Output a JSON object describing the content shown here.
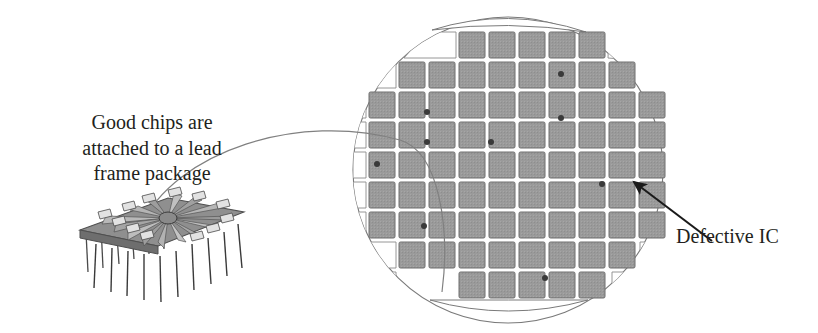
{
  "figure": {
    "name": "semiconductor-wafer-die-map",
    "background_color": "#ffffff"
  },
  "labels": {
    "good_chips": {
      "line1": "Good chips are",
      "line2": "attached to a lead",
      "line3": "frame package"
    },
    "defective": "Defective IC"
  },
  "colors": {
    "die_fill": "#9a9a9a",
    "die_stroke": "#6f6f6f",
    "partial_die_fill": "#ffffff",
    "partial_die_stroke": "#8a8a8a",
    "wafer_stroke": "#7a7a7a",
    "defect_dot": "#3a3a3a",
    "leader_line": "#808080",
    "arrow": "#1a1a1a",
    "package_body": "#8f8f8f",
    "package_dark": "#5f5f5f",
    "package_light": "#cfcfcf",
    "text": "#231f20"
  },
  "wafer": {
    "center_x": 508,
    "center_y": 170,
    "radius_x": 155,
    "radius_y": 153,
    "die_pitch": 30,
    "die_size": 26,
    "grid_origin_x": 369,
    "grid_origin_y": 32,
    "columns": 10,
    "rows": 10,
    "die_rows": [
      {
        "row": 0,
        "y": 32,
        "full_dies_x": [
          459,
          489,
          519,
          549,
          579
        ],
        "partial_dies": [
          {
            "x": 429,
            "w": 26
          },
          {
            "x": 609,
            "w": 26
          }
        ]
      },
      {
        "row": 1,
        "y": 62,
        "full_dies_x": [
          399,
          429,
          459,
          489,
          519,
          549,
          579,
          609
        ],
        "partial_dies": [
          {
            "x": 369,
            "w": 26
          },
          {
            "x": 639,
            "w": 22
          }
        ]
      },
      {
        "row": 2,
        "y": 92,
        "full_dies_x": [
          369,
          399,
          429,
          459,
          489,
          519,
          549,
          579,
          609,
          639
        ],
        "partial_dies": []
      },
      {
        "row": 3,
        "y": 122,
        "full_dies_x": [
          369,
          399,
          429,
          459,
          489,
          519,
          549,
          579,
          609,
          639
        ],
        "partial_dies": []
      },
      {
        "row": 4,
        "y": 152,
        "full_dies_x": [
          369,
          399,
          429,
          459,
          489,
          519,
          549,
          579,
          609,
          639
        ],
        "partial_dies": []
      },
      {
        "row": 5,
        "y": 182,
        "full_dies_x": [
          369,
          399,
          429,
          459,
          489,
          519,
          549,
          579,
          609,
          639
        ],
        "partial_dies": []
      },
      {
        "row": 6,
        "y": 212,
        "full_dies_x": [
          369,
          399,
          429,
          459,
          489,
          519,
          549,
          579,
          609,
          639
        ],
        "partial_dies": []
      },
      {
        "row": 7,
        "y": 242,
        "full_dies_x": [
          399,
          429,
          459,
          489,
          519,
          549,
          579,
          609
        ],
        "partial_dies": [
          {
            "x": 369,
            "w": 26
          },
          {
            "x": 639,
            "w": 22
          }
        ]
      },
      {
        "row": 8,
        "y": 272,
        "full_dies_x": [
          459,
          489,
          519,
          549,
          579
        ],
        "partial_dies": [
          {
            "x": 399,
            "w": 26
          },
          {
            "x": 609,
            "w": 26
          }
        ]
      }
    ],
    "defect_dots": [
      {
        "id": 1,
        "x": 561,
        "y": 74,
        "label": "defect-1"
      },
      {
        "id": 2,
        "x": 427,
        "y": 112,
        "label": "defect-2"
      },
      {
        "id": 3,
        "x": 561,
        "y": 118,
        "label": "defect-3"
      },
      {
        "id": 4,
        "x": 427,
        "y": 142,
        "label": "defect-4"
      },
      {
        "id": 5,
        "x": 491,
        "y": 142,
        "label": "defect-5"
      },
      {
        "id": 6,
        "x": 377,
        "y": 164,
        "label": "defect-6"
      },
      {
        "id": 7,
        "x": 602,
        "y": 184,
        "label": "defect-7"
      },
      {
        "id": 8,
        "x": 424,
        "y": 226,
        "label": "defect-8"
      },
      {
        "id": 9,
        "x": 545,
        "y": 278,
        "label": "defect-9"
      }
    ],
    "defect_dot_radius": 3,
    "top_crescent": {
      "cx": 508,
      "cy": 27,
      "label": "top-edge-crescent"
    },
    "bottom_crescent": {
      "cx": 508,
      "cy": 306,
      "label": "bottom-edge-crescent"
    }
  },
  "leader_curve": {
    "label": "good-chips-leader-curve",
    "path": "M 140 227 C 176 150 300 112 400 140 C 440 152 450 230 442 292"
  },
  "arrow": {
    "label": "defective-ic-arrow",
    "from_x": 712,
    "from_y": 241,
    "to_x": 634,
    "to_y": 182
  },
  "package": {
    "label": "dip-lead-frame-package",
    "pin_count": 16,
    "origin_x": 72,
    "origin_y": 196
  }
}
